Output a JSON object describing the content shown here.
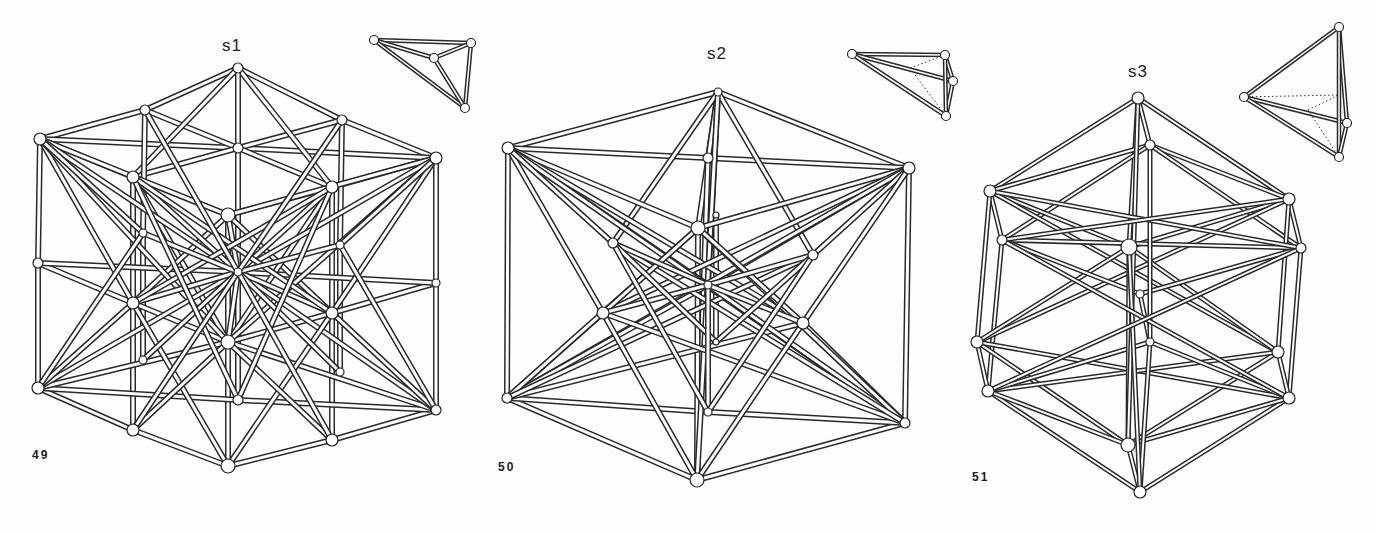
{
  "figures": [
    {
      "id": "fig49",
      "number": "49",
      "label": "s1",
      "label_pos": [
        222,
        50
      ],
      "number_pos": [
        32,
        458
      ],
      "rod_width": 6,
      "nodes": [
        [
          238,
          68
        ],
        [
          145,
          110
        ],
        [
          342,
          120
        ],
        [
          40,
          139
        ],
        [
          238,
          148
        ],
        [
          436,
          158
        ],
        [
          133,
          177
        ],
        [
          332,
          187
        ],
        [
          228,
          215
        ],
        [
          143,
          233
        ],
        [
          340,
          245
        ],
        [
          38,
          263
        ],
        [
          238,
          272
        ],
        [
          436,
          283
        ],
        [
          133,
          303
        ],
        [
          332,
          313
        ],
        [
          228,
          342
        ],
        [
          143,
          360
        ],
        [
          340,
          372
        ],
        [
          38,
          388
        ],
        [
          238,
          400
        ],
        [
          436,
          410
        ],
        [
          133,
          430
        ],
        [
          332,
          440
        ],
        [
          228,
          466
        ]
      ],
      "node_r": [
        5,
        5,
        5,
        6,
        5,
        6,
        6,
        6,
        7,
        4,
        4,
        5,
        4,
        4,
        6,
        6,
        7,
        4,
        4,
        6,
        5,
        5,
        6,
        6,
        7
      ],
      "edges": [
        [
          0,
          1
        ],
        [
          0,
          2
        ],
        [
          1,
          3
        ],
        [
          2,
          5
        ],
        [
          3,
          4
        ],
        [
          4,
          5
        ],
        [
          0,
          4
        ],
        [
          1,
          4
        ],
        [
          2,
          4
        ],
        [
          3,
          6
        ],
        [
          6,
          8
        ],
        [
          8,
          7
        ],
        [
          7,
          5
        ],
        [
          4,
          6
        ],
        [
          4,
          7
        ],
        [
          0,
          6
        ],
        [
          0,
          7
        ],
        [
          3,
          11
        ],
        [
          11,
          19
        ],
        [
          5,
          13
        ],
        [
          13,
          21
        ],
        [
          6,
          14
        ],
        [
          14,
          22
        ],
        [
          7,
          15
        ],
        [
          15,
          23
        ],
        [
          8,
          16
        ],
        [
          16,
          24
        ],
        [
          1,
          9
        ],
        [
          9,
          17
        ],
        [
          2,
          10
        ],
        [
          10,
          18
        ],
        [
          0,
          12
        ],
        [
          12,
          20
        ],
        [
          11,
          14
        ],
        [
          14,
          16
        ],
        [
          16,
          15
        ],
        [
          15,
          13
        ],
        [
          11,
          12
        ],
        [
          12,
          13
        ],
        [
          19,
          22
        ],
        [
          22,
          24
        ],
        [
          24,
          23
        ],
        [
          23,
          21
        ],
        [
          19,
          20
        ],
        [
          20,
          21
        ],
        [
          3,
          8
        ],
        [
          5,
          8
        ],
        [
          6,
          16
        ],
        [
          8,
          14
        ],
        [
          8,
          15
        ],
        [
          7,
          16
        ],
        [
          3,
          14
        ],
        [
          3,
          16
        ],
        [
          3,
          12
        ],
        [
          3,
          9
        ],
        [
          5,
          15
        ],
        [
          5,
          16
        ],
        [
          5,
          12
        ],
        [
          5,
          10
        ],
        [
          19,
          16
        ],
        [
          19,
          12
        ],
        [
          19,
          14
        ],
        [
          19,
          9
        ],
        [
          21,
          16
        ],
        [
          21,
          12
        ],
        [
          21,
          15
        ],
        [
          21,
          10
        ],
        [
          6,
          12
        ],
        [
          7,
          12
        ],
        [
          14,
          12
        ],
        [
          15,
          12
        ],
        [
          16,
          12
        ],
        [
          8,
          12
        ],
        [
          6,
          15
        ],
        [
          7,
          14
        ],
        [
          14,
          24
        ],
        [
          15,
          24
        ],
        [
          9,
          12
        ],
        [
          10,
          12
        ],
        [
          17,
          12
        ],
        [
          18,
          12
        ],
        [
          22,
          16
        ],
        [
          23,
          16
        ],
        [
          6,
          20
        ],
        [
          7,
          20
        ],
        [
          22,
          12
        ],
        [
          23,
          12
        ],
        [
          1,
          12
        ],
        [
          2,
          12
        ]
      ],
      "inset": {
        "nodes": [
          [
            374,
            40
          ],
          [
            471,
            43
          ],
          [
            434,
            58
          ],
          [
            465,
            108
          ]
        ],
        "edges": [
          [
            0,
            1
          ],
          [
            0,
            2
          ],
          [
            0,
            3
          ],
          [
            1,
            2
          ],
          [
            1,
            3
          ],
          [
            2,
            3
          ]
        ],
        "dotted": []
      }
    },
    {
      "id": "fig50",
      "number": "50",
      "label": "s2",
      "label_pos": [
        707,
        58
      ],
      "number_pos": [
        498,
        470
      ],
      "rod_width": 6,
      "nodes": [
        [
          718,
          92
        ],
        [
          508,
          148
        ],
        [
          708,
          158
        ],
        [
          909,
          168
        ],
        [
          698,
          228
        ],
        [
          716,
          215
        ],
        [
          613,
          243
        ],
        [
          813,
          255
        ],
        [
          708,
          285
        ],
        [
          603,
          313
        ],
        [
          803,
          323
        ],
        [
          716,
          342
        ],
        [
          507,
          398
        ],
        [
          708,
          412
        ],
        [
          905,
          423
        ],
        [
          697,
          480
        ]
      ],
      "node_r": [
        4,
        6,
        5,
        6,
        7,
        3,
        5,
        5,
        4,
        6,
        6,
        3,
        5,
        4,
        5,
        7
      ],
      "edges": [
        [
          0,
          1
        ],
        [
          0,
          3
        ],
        [
          1,
          2
        ],
        [
          2,
          3
        ],
        [
          0,
          2
        ],
        [
          0,
          4
        ],
        [
          0,
          8
        ],
        [
          0,
          6
        ],
        [
          0,
          7
        ],
        [
          1,
          12
        ],
        [
          3,
          14
        ],
        [
          12,
          15
        ],
        [
          15,
          14
        ],
        [
          12,
          13
        ],
        [
          13,
          14
        ],
        [
          2,
          15
        ],
        [
          4,
          15
        ],
        [
          5,
          11
        ],
        [
          0,
          15
        ],
        [
          1,
          4
        ],
        [
          3,
          4
        ],
        [
          1,
          8
        ],
        [
          3,
          8
        ],
        [
          1,
          10
        ],
        [
          3,
          9
        ],
        [
          1,
          14
        ],
        [
          3,
          12
        ],
        [
          1,
          9
        ],
        [
          1,
          6
        ],
        [
          3,
          7
        ],
        [
          3,
          10
        ],
        [
          12,
          9
        ],
        [
          12,
          10
        ],
        [
          12,
          8
        ],
        [
          12,
          4
        ],
        [
          12,
          7
        ],
        [
          14,
          10
        ],
        [
          14,
          9
        ],
        [
          14,
          8
        ],
        [
          14,
          4
        ],
        [
          14,
          6
        ],
        [
          4,
          9
        ],
        [
          4,
          10
        ],
        [
          9,
          15
        ],
        [
          10,
          15
        ],
        [
          6,
          8
        ],
        [
          7,
          8
        ],
        [
          9,
          8
        ],
        [
          10,
          8
        ],
        [
          6,
          11
        ],
        [
          7,
          11
        ],
        [
          8,
          13
        ],
        [
          6,
          13
        ],
        [
          7,
          13
        ]
      ],
      "inset": {
        "nodes": [
          [
            852,
            54
          ],
          [
            945,
            55
          ],
          [
            953,
            81
          ],
          [
            946,
            116
          ]
        ],
        "edges": [
          [
            0,
            1
          ],
          [
            0,
            2
          ],
          [
            0,
            3
          ],
          [
            1,
            2
          ],
          [
            2,
            3
          ],
          [
            1,
            3
          ]
        ],
        "dotted": [
          [
            [
              910,
              68
            ],
            [
              945,
              55
            ]
          ],
          [
            [
              915,
              75
            ],
            [
              946,
              116
            ]
          ]
        ]
      }
    },
    {
      "id": "fig51",
      "number": "51",
      "label": "s3",
      "label_pos": [
        1128,
        76
      ],
      "number_pos": [
        972,
        480
      ],
      "rod_width": 5,
      "nodes": [
        [
          1138,
          98
        ],
        [
          1150,
          145
        ],
        [
          990,
          191
        ],
        [
          1289,
          199
        ],
        [
          1002,
          240
        ],
        [
          1129,
          247
        ],
        [
          1301,
          248
        ],
        [
          1140,
          294
        ],
        [
          1150,
          342
        ],
        [
          977,
          342
        ],
        [
          1278,
          352
        ],
        [
          988,
          391
        ],
        [
          1289,
          398
        ],
        [
          1128,
          445
        ],
        [
          1140,
          492
        ]
      ],
      "node_r": [
        6,
        5,
        6,
        6,
        5,
        8,
        5,
        4,
        4,
        6,
        6,
        6,
        6,
        7,
        6
      ],
      "edges": [
        [
          0,
          2
        ],
        [
          0,
          3
        ],
        [
          0,
          1
        ],
        [
          0,
          5
        ],
        [
          1,
          2
        ],
        [
          1,
          3
        ],
        [
          1,
          4
        ],
        [
          1,
          6
        ],
        [
          2,
          4
        ],
        [
          3,
          6
        ],
        [
          2,
          5
        ],
        [
          3,
          5
        ],
        [
          2,
          9
        ],
        [
          3,
          10
        ],
        [
          4,
          11
        ],
        [
          6,
          12
        ],
        [
          2,
          10
        ],
        [
          3,
          9
        ],
        [
          5,
          9
        ],
        [
          5,
          10
        ],
        [
          4,
          6
        ],
        [
          4,
          7
        ],
        [
          6,
          7
        ],
        [
          9,
          11
        ],
        [
          10,
          12
        ],
        [
          9,
          13
        ],
        [
          10,
          13
        ],
        [
          11,
          14
        ],
        [
          12,
          14
        ],
        [
          13,
          14
        ],
        [
          9,
          12
        ],
        [
          10,
          11
        ],
        [
          11,
          13
        ],
        [
          12,
          13
        ],
        [
          11,
          8
        ],
        [
          12,
          8
        ],
        [
          8,
          14
        ],
        [
          5,
          13
        ],
        [
          7,
          8
        ],
        [
          1,
          8
        ],
        [
          0,
          13
        ],
        [
          5,
          14
        ],
        [
          4,
          12
        ],
        [
          6,
          11
        ],
        [
          2,
          6
        ],
        [
          3,
          4
        ]
      ],
      "inset": {
        "nodes": [
          [
            1244,
            97
          ],
          [
            1339,
            27
          ],
          [
            1347,
            123
          ],
          [
            1339,
            157
          ]
        ],
        "edges": [
          [
            0,
            1
          ],
          [
            0,
            2
          ],
          [
            0,
            3
          ],
          [
            1,
            2
          ],
          [
            1,
            3
          ],
          [
            2,
            3
          ]
        ],
        "dotted": [
          [
            [
              1244,
              97
            ],
            [
              1339,
              95
            ]
          ],
          [
            [
              1308,
              110
            ],
            [
              1339,
              157
            ]
          ],
          [
            [
              1308,
              110
            ],
            [
              1339,
              95
            ]
          ]
        ]
      }
    }
  ],
  "colors": {
    "background": "#fdfdfd",
    "ink": "#2a2a2a",
    "rod_fill": "#ffffff"
  }
}
